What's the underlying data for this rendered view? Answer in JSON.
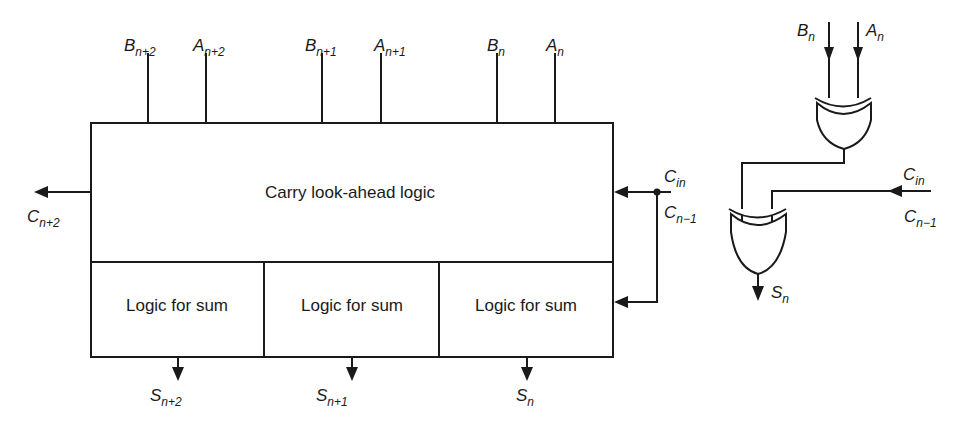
{
  "diagram": {
    "main_block": {
      "label": "Carry look-ahead logic",
      "sum_blocks": [
        {
          "label": "Logic for sum",
          "output": {
            "base": "S",
            "sub": "n+2"
          }
        },
        {
          "label": "Logic for sum",
          "output": {
            "base": "S",
            "sub": "n+1"
          }
        },
        {
          "label": "Logic for sum",
          "output": {
            "base": "S",
            "sub": "n"
          }
        }
      ]
    },
    "inputs": [
      {
        "base": "B",
        "sub": "n+2"
      },
      {
        "base": "A",
        "sub": "n+2"
      },
      {
        "base": "B",
        "sub": "n+1"
      },
      {
        "base": "A",
        "sub": "n+1"
      },
      {
        "base": "B",
        "sub": "n"
      },
      {
        "base": "A",
        "sub": "n"
      }
    ],
    "carry_out": {
      "base": "C",
      "sub": "n+2"
    },
    "carry_in": {
      "base": "C",
      "sub": "in"
    },
    "carry_prev": {
      "base": "C",
      "sub": "n−1"
    },
    "detail": {
      "inputs": [
        {
          "base": "B",
          "sub": "n"
        },
        {
          "base": "A",
          "sub": "n"
        }
      ],
      "gates": [
        "xor-gate",
        "xor-gate"
      ],
      "carry_in": {
        "base": "C",
        "sub": "in"
      },
      "carry_prev": {
        "base": "C",
        "sub": "n−1"
      },
      "output": {
        "base": "S",
        "sub": "n"
      }
    }
  }
}
